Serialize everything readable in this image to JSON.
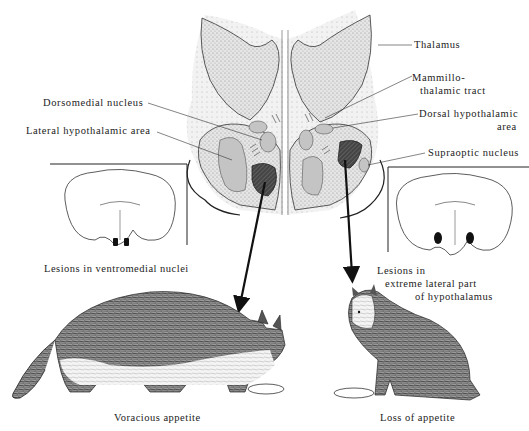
{
  "diagram": {
    "brain_section_labels": {
      "thalamus": "Thalamus",
      "mammillothalamic_tract_line1": "Mammillo-",
      "mammillothalamic_tract_line2": "thalamic tract",
      "dorsal_hypothalamic_area_line1": "Dorsal hypothalamic",
      "dorsal_hypothalamic_area_line2": "area",
      "supraoptic_nucleus": "Supraoptic nucleus",
      "dorsomedial_nucleus": "Dorsomedial nucleus",
      "lateral_hypothalamic_area": "Lateral hypothalamic area"
    },
    "left_panel": {
      "lesion_caption": "Lesions in ventromedial nuclei",
      "outcome_caption": "Voracious appetite"
    },
    "right_panel": {
      "lesion_caption_line1": "Lesions in",
      "lesion_caption_line2": "extreme lateral part",
      "lesion_caption_line3": "of hypothalamus",
      "outcome_caption": "Loss of appetite"
    },
    "colors": {
      "stipple_bg": "#d9d9d9",
      "nucleus_fill": "#c4c4c4",
      "lesion_fill": "#3a3a3a",
      "ink": "#222222"
    }
  }
}
